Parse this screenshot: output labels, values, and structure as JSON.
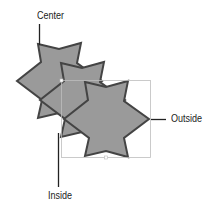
{
  "diagram": {
    "labels": {
      "center": "Center",
      "outside": "Outside",
      "inside": "Inside"
    },
    "colors": {
      "fill": "#9a9a9a",
      "stroke": "#444444",
      "bbox": "#bdbdbd",
      "leader": "#222222"
    },
    "shapes": [
      {
        "name": "star-center",
        "stroke_position": "center"
      },
      {
        "name": "star-inside",
        "stroke_position": "inside"
      },
      {
        "name": "star-outside",
        "stroke_position": "outside"
      }
    ]
  }
}
